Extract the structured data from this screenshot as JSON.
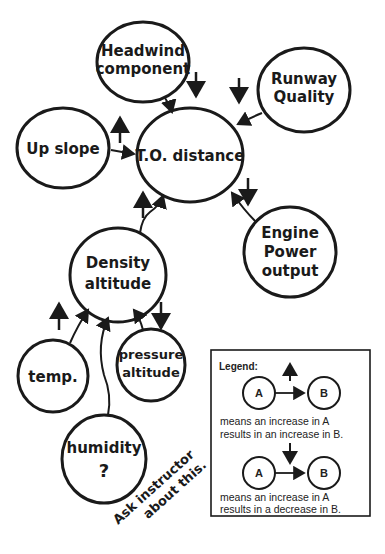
{
  "diagram": {
    "center": {
      "label": "T.O. distance"
    },
    "nodes": [
      {
        "id": "headwind",
        "line1": "Headwind",
        "line2": "component",
        "effect": "decrease",
        "target": "T.O. distance"
      },
      {
        "id": "runway",
        "line1": "Runway",
        "line2": "Quality",
        "effect": "decrease",
        "target": "T.O. distance"
      },
      {
        "id": "upslope",
        "line1": "Up slope",
        "effect": "increase",
        "target": "T.O. distance"
      },
      {
        "id": "engine",
        "line1": "Engine",
        "line2": "Power",
        "line3": "output",
        "effect": "decrease",
        "target": "T.O. distance"
      },
      {
        "id": "density",
        "line1": "Density",
        "line2": "altitude",
        "effect": "increase",
        "target": "T.O. distance"
      },
      {
        "id": "temp",
        "line1": "temp.",
        "effect": "increase",
        "target": "Density altitude"
      },
      {
        "id": "pressure",
        "line1": "pressure",
        "line2": "altitude",
        "effect": "decrease",
        "target": "Density altitude"
      },
      {
        "id": "humidity",
        "line1": "humidity",
        "line2": "?",
        "effect": "unknown",
        "target": "Density altitude"
      }
    ],
    "note": {
      "line1": "Ask instructor",
      "line2": "about this."
    }
  },
  "legend": {
    "title": "Legend:",
    "node_a": "A",
    "node_b": "B",
    "increase_line1": "means an increase in A",
    "increase_line2": "results in an increase in B.",
    "decrease_line1": "means an increase in A",
    "decrease_line2": "results in a decrease in B."
  },
  "colors": {
    "ink": "#1a1a1a",
    "background": "#ffffff"
  }
}
